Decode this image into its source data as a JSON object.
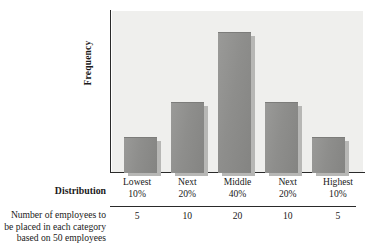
{
  "chart_data": {
    "type": "bar",
    "title": "",
    "xlabel": "Distribution",
    "ylabel": "Frequency",
    "grid": false,
    "legend": "none",
    "categories": [
      "Lowest 10%",
      "Next 20%",
      "Middle 40%",
      "Next 20%",
      "Highest 10%"
    ],
    "category_lines": [
      {
        "line1": "Lowest",
        "line2": "10%"
      },
      {
        "line1": "Next",
        "line2": "20%"
      },
      {
        "line1": "Middle",
        "line2": "40%"
      },
      {
        "line1": "Next",
        "line2": "20%"
      },
      {
        "line1": "Highest",
        "line2": "10%"
      }
    ],
    "values": [
      5,
      10,
      20,
      10,
      5
    ],
    "value_labels": [
      "5",
      "10",
      "20",
      "10",
      "5"
    ],
    "ylim": [
      0,
      23
    ],
    "bar_color": "#8e8e8c",
    "bar_shadow_color": "#b7b7b5",
    "plot_background": "#efefed",
    "axis_color": "#2a2a2a"
  },
  "axis": {
    "y_title": "Frequency"
  },
  "table": {
    "distribution_label": "Distribution",
    "note_lines": [
      "Number of employees to",
      "be placed in each category",
      "based on 50 employees"
    ]
  }
}
